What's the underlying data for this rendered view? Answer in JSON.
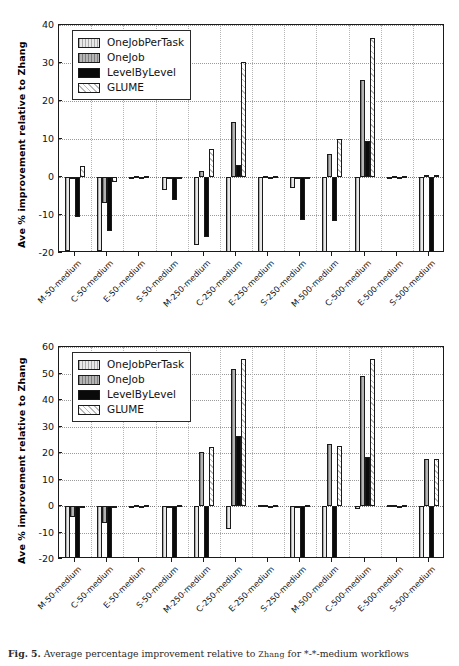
{
  "caption": {
    "prefix": "Fig. 5.",
    "text_before": " Average percentage improvement relative to ",
    "smallcaps": "Zhang",
    "text_after": " for *-*-medium workflows"
  },
  "series_names": [
    "OneJobPerTask",
    "OneJob",
    "LevelByLevel",
    "GLUME"
  ],
  "colors": {
    "OneJobPerTask": "#e8e8e8",
    "OneJob": "#b4b4b4",
    "LevelByLevel": "#0a0a0a",
    "GLUME": "#fdfdfd",
    "axis": "#1a1a1a",
    "grid": "#9a9a9a"
  },
  "chart_data": [
    {
      "type": "bar",
      "id": "top",
      "title": "",
      "xlabel": "",
      "ylabel": "Ave % improvement relative to Zhang",
      "ylim": [
        -20,
        40
      ],
      "yticks": [
        -20,
        -10,
        0,
        10,
        20,
        30,
        40
      ],
      "grid": true,
      "legend_position": "upper-left",
      "legend": [
        "OneJobPerTask",
        "OneJob",
        "LevelByLevel",
        "GLUME"
      ],
      "categories": [
        "M-50-medium",
        "C-50-medium",
        "E-50-medium",
        "S-50-medium",
        "M-250-medium",
        "C-250-medium",
        "E-250-medium",
        "S-250-medium",
        "M-500-medium",
        "C-500-medium",
        "E-500-medium",
        "S-500-medium"
      ],
      "series": [
        {
          "name": "OneJobPerTask",
          "values": [
            -19.5,
            -19.5,
            0.0,
            -3.3,
            -18.0,
            -20.0,
            -20.0,
            -2.8,
            -20.0,
            -20.0,
            0.0,
            -20.0
          ]
        },
        {
          "name": "OneJob",
          "values": [
            0.0,
            -6.8,
            0.2,
            0.0,
            1.6,
            14.5,
            0.3,
            0.0,
            6.1,
            25.4,
            0.3,
            0.5
          ]
        },
        {
          "name": "LevelByLevel",
          "values": [
            -10.4,
            -14.1,
            0.1,
            -6.0,
            -15.9,
            3.1,
            0.1,
            -11.2,
            -11.5,
            9.5,
            0.1,
            -20.0
          ]
        },
        {
          "name": "GLUME",
          "values": [
            3.0,
            -1.4,
            0.2,
            0.1,
            7.3,
            30.3,
            0.3,
            0.1,
            9.9,
            36.5,
            0.2,
            0.6
          ]
        }
      ]
    },
    {
      "type": "bar",
      "id": "bottom",
      "title": "",
      "xlabel": "",
      "ylabel": "Ave % improvement relative to Zhang",
      "ylim": [
        -20,
        60
      ],
      "yticks": [
        -20,
        -10,
        0,
        10,
        20,
        30,
        40,
        50,
        60
      ],
      "grid": true,
      "legend_position": "upper-left",
      "legend": [
        "OneJobPerTask",
        "OneJob",
        "LevelByLevel",
        "GLUME"
      ],
      "categories": [
        "M-50-medium",
        "C-50-medium",
        "E-50-medium",
        "S-50-medium",
        "M-250-medium",
        "C-250-medium",
        "E-250-medium",
        "S-250-medium",
        "M-500-medium",
        "C-500-medium",
        "E-500-medium",
        "S-500-medium"
      ],
      "series": [
        {
          "name": "OneJobPerTask",
          "values": [
            -20.0,
            -20.0,
            0.1,
            -20.0,
            -20.0,
            -8.7,
            0.2,
            -20.0,
            -20.0,
            -1.3,
            0.2,
            -20.0
          ]
        },
        {
          "name": "OneJob",
          "values": [
            -4.0,
            -6.4,
            0.2,
            -0.3,
            20.2,
            51.7,
            0.3,
            -0.4,
            23.5,
            49.0,
            0.3,
            17.6
          ]
        },
        {
          "name": "LevelByLevel",
          "values": [
            -20.0,
            -20.0,
            0.1,
            -20.0,
            -20.0,
            26.5,
            0.1,
            -20.0,
            -20.0,
            18.6,
            0.1,
            -20.0
          ]
        },
        {
          "name": "GLUME",
          "values": [
            -0.6,
            -0.7,
            0.3,
            0.2,
            22.2,
            55.3,
            0.3,
            0.2,
            22.7,
            55.3,
            0.3,
            17.7
          ]
        }
      ]
    }
  ]
}
